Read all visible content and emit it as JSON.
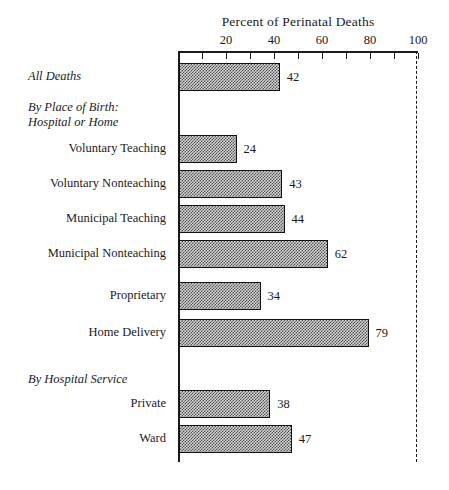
{
  "chart_data": {
    "type": "bar",
    "orientation": "horizontal",
    "title": "Percent of Perinatal Deaths",
    "xlabel": "",
    "ylabel": "",
    "xlim": [
      0,
      100
    ],
    "xticks": [
      0,
      10,
      20,
      30,
      40,
      50,
      60,
      70,
      80,
      90,
      100
    ],
    "xtick_labels": [
      "20",
      "40",
      "60",
      "80",
      "100"
    ],
    "xtick_label_values": [
      20,
      40,
      60,
      80,
      100
    ],
    "grid": false,
    "legend": null,
    "reference_line": 100,
    "categories": [
      "All Deaths",
      "Voluntary Teaching",
      "Voluntary Nonteaching",
      "Municipal Teaching",
      "Municipal Nonteaching",
      "Proprietary",
      "Home Delivery",
      "Private",
      "Ward"
    ],
    "values": [
      42,
      24,
      43,
      44,
      62,
      34,
      79,
      38,
      47
    ],
    "group_headings": [
      "By Place of Birth:",
      "Hospital or Home",
      "By Hospital Service"
    ],
    "rows": [
      {
        "label": "All Deaths",
        "value": 42,
        "style": "italic",
        "indent": 0,
        "top": 63,
        "height": 28
      },
      {
        "label": "By Place of Birth:",
        "value": null,
        "style": "italic-heading",
        "indent": 0,
        "top": 100,
        "height": 0
      },
      {
        "label": "Hospital or Home",
        "value": null,
        "style": "italic-heading",
        "indent": 0,
        "top": 115,
        "height": 0
      },
      {
        "label": "Voluntary Teaching",
        "value": 24,
        "style": "roman",
        "indent": 1,
        "top": 135,
        "height": 28
      },
      {
        "label": "Voluntary Nonteaching",
        "value": 43,
        "style": "roman",
        "indent": 1,
        "top": 170,
        "height": 28
      },
      {
        "label": "Municipal Teaching",
        "value": 44,
        "style": "roman",
        "indent": 1,
        "top": 205,
        "height": 28
      },
      {
        "label": "Municipal Nonteaching",
        "value": 62,
        "style": "roman",
        "indent": 1,
        "top": 240,
        "height": 28
      },
      {
        "label": "Proprietary",
        "value": 34,
        "style": "roman",
        "indent": 1,
        "top": 282,
        "height": 28
      },
      {
        "label": "Home Delivery",
        "value": 79,
        "style": "roman",
        "indent": 1,
        "top": 319,
        "height": 28
      },
      {
        "label": "By Hospital Service",
        "value": null,
        "style": "italic-heading",
        "indent": 0,
        "top": 372,
        "height": 0
      },
      {
        "label": "Private",
        "value": 38,
        "style": "roman",
        "indent": 1,
        "top": 390,
        "height": 28
      },
      {
        "label": "Ward",
        "value": 47,
        "style": "roman",
        "indent": 1,
        "top": 425,
        "height": 28
      }
    ]
  },
  "axis": {
    "title": "Percent of Perinatal Deaths",
    "tick_labels": [
      "20",
      "40",
      "60",
      "80",
      "100"
    ]
  }
}
